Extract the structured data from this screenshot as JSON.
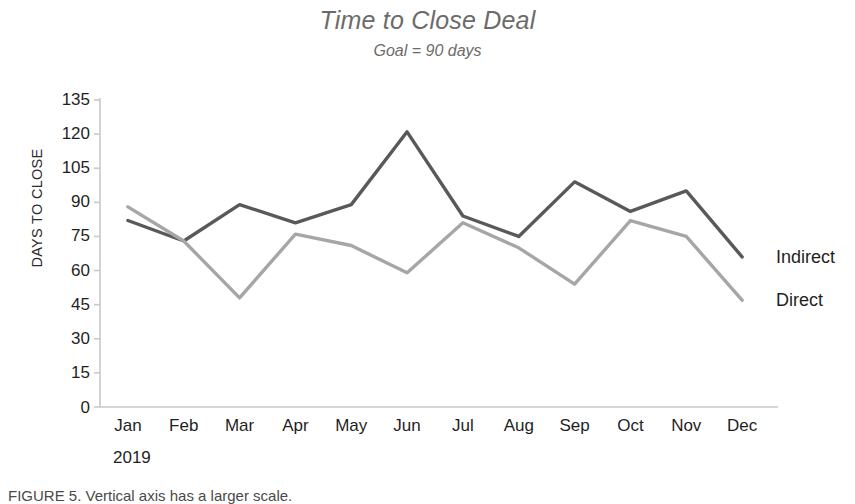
{
  "chart_data": {
    "type": "line",
    "title": "Time to Close Deal",
    "subtitle": "Goal = 90 days",
    "xlabel": "2019",
    "ylabel": "DAYS TO CLOSE",
    "categories": [
      "Jan",
      "Feb",
      "Mar",
      "Apr",
      "May",
      "Jun",
      "Jul",
      "Aug",
      "Sep",
      "Oct",
      "Nov",
      "Dec"
    ],
    "yticks": [
      0,
      15,
      30,
      45,
      60,
      75,
      90,
      105,
      120,
      135
    ],
    "ylim": [
      0,
      135
    ],
    "grid": false,
    "legend_position": "right-of-line-ends",
    "series": [
      {
        "name": "Indirect",
        "color": "#595959",
        "values": [
          82,
          73,
          89,
          81,
          89,
          121,
          84,
          75,
          99,
          86,
          95,
          66
        ]
      },
      {
        "name": "Direct",
        "color": "#a6a6a6",
        "values": [
          88,
          73,
          48,
          76,
          71,
          59,
          81,
          70,
          54,
          82,
          75,
          47
        ]
      }
    ]
  },
  "axes": {
    "axis_color": "#c9c9c9",
    "tick_color": "#c9c9c9"
  },
  "caption": {
    "text": "FIGURE 5.  Vertical axis has a larger scale."
  }
}
